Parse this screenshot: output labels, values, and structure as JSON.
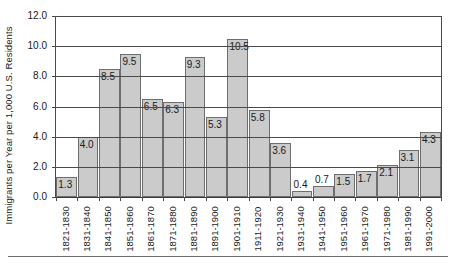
{
  "chart_data": {
    "type": "bar",
    "title": "",
    "xlabel": "",
    "ylabel": "Immigrants per Year per 1,000 U.S. Residents",
    "ylim": [
      0,
      12
    ],
    "ytick_labels": [
      "0.0",
      "2.0",
      "4.0",
      "6.0",
      "8.0",
      "10.0",
      "12.0"
    ],
    "ytick_values": [
      0,
      2,
      4,
      6,
      8,
      10,
      12
    ],
    "grid": true,
    "legend": "none",
    "categories": [
      "1821-1830",
      "1831-1840",
      "1841-1850",
      "1851-1860",
      "1861-1870",
      "1871-1880",
      "1881-1890",
      "1891-1900",
      "1901-1910",
      "1911-1920",
      "1921-1930",
      "1931-1940",
      "1941-1950",
      "1951-1960",
      "1961-1970",
      "1971-1980",
      "1981-1990",
      "1991-2000"
    ],
    "values": [
      1.3,
      4.0,
      8.5,
      9.5,
      6.5,
      6.3,
      9.3,
      5.3,
      10.5,
      5.8,
      3.6,
      0.4,
      0.7,
      1.5,
      1.7,
      2.1,
      3.1,
      4.3
    ],
    "data_labels": [
      "1.3",
      "4.0",
      "8.5",
      "9.5",
      "6.5",
      "6.3",
      "9.3",
      "5.3",
      "10.5",
      "5.8",
      "3.6",
      "0.4",
      "0.7",
      "1.5",
      "1.7",
      "2.1",
      "3.1",
      "4.3"
    ],
    "bar_color": "#cbcbcb",
    "bar_border_color": "#6e6e6e",
    "axis_color": "#4a4a4a"
  }
}
